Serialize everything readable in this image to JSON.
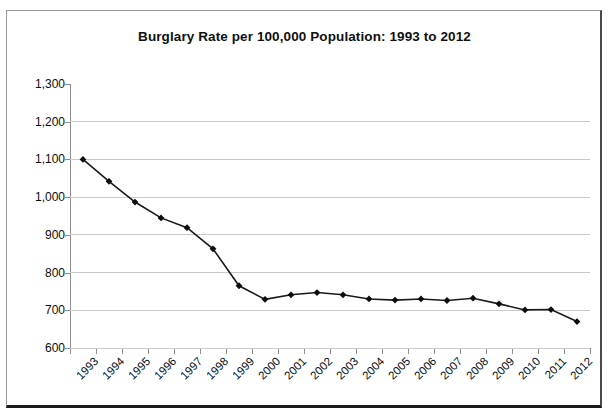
{
  "chart_data": {
    "type": "line",
    "title": "Burglary Rate per 100,000 Population: 1993 to 2012",
    "xlabel": "",
    "ylabel": "",
    "categories": [
      "1993",
      "1994",
      "1995",
      "1996",
      "1997",
      "1998",
      "1999",
      "2000",
      "2001",
      "2002",
      "2003",
      "2004",
      "2005",
      "2006",
      "2007",
      "2008",
      "2009",
      "2010",
      "2011",
      "2012"
    ],
    "values": [
      1100,
      1042,
      987,
      945,
      919,
      863,
      765,
      729,
      741,
      747,
      741,
      730,
      727,
      730,
      726,
      732,
      717,
      701,
      702,
      670
    ],
    "series": [
      {
        "name": "Burglary rate per 100,000",
        "values": [
          1100,
          1042,
          987,
          945,
          919,
          863,
          765,
          729,
          741,
          747,
          741,
          730,
          727,
          730,
          726,
          732,
          717,
          701,
          702,
          670
        ]
      }
    ],
    "ylim": [
      600,
      1300
    ],
    "ytick_values": [
      600,
      700,
      800,
      900,
      1000,
      1100,
      1200,
      1300
    ],
    "ytick_labels": [
      "600",
      "700",
      "800",
      "900",
      "1,000",
      "1,100",
      "1,200",
      "1,300"
    ],
    "grid": "horizontal",
    "legend": "none",
    "marker": "diamond",
    "line_color": "#1a1a1a",
    "marker_color": "#0d0d0d",
    "grid_color": "#c9c9c9",
    "axis_color": "#8d8d8d"
  }
}
